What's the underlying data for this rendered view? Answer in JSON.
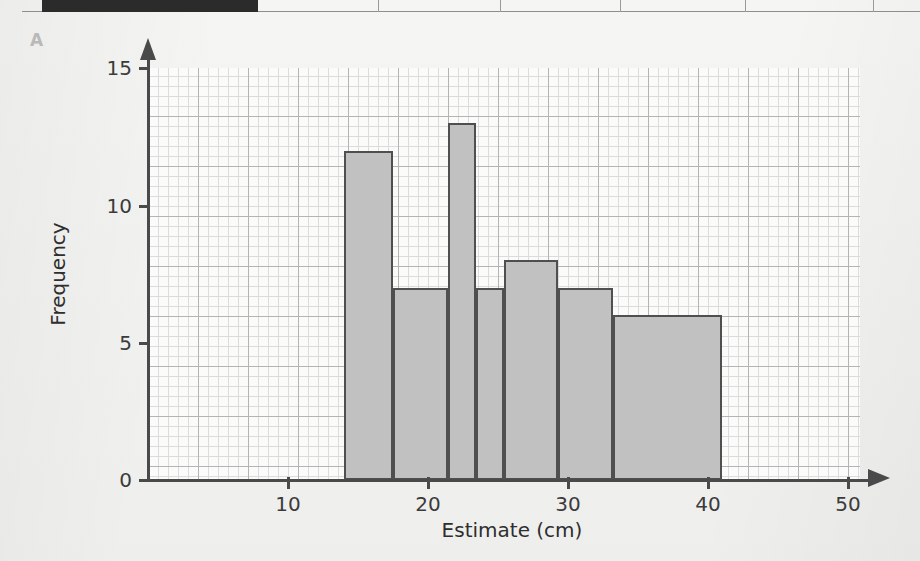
{
  "figure": {
    "label": "A"
  },
  "header_strip": {
    "black_cell": true,
    "divider_count": 5
  },
  "chart_data": {
    "type": "bar",
    "title": "",
    "subtitle": "",
    "xlabel": "Estimate (cm)",
    "ylabel": "Frequency",
    "xlim": [
      0,
      52
    ],
    "ylim": [
      0,
      15
    ],
    "grid": true,
    "legend": null,
    "xticks": [
      10,
      20,
      30,
      40,
      50
    ],
    "xtick_labels": [
      "10",
      "20",
      "30",
      "40",
      "50"
    ],
    "yticks": [
      0,
      5,
      10,
      15
    ],
    "ytick_labels": [
      "0",
      "5",
      "10",
      "15"
    ],
    "bins": [
      {
        "start": 14.0,
        "end": 17.5,
        "value": 12
      },
      {
        "start": 17.5,
        "end": 21.4,
        "value": 7
      },
      {
        "start": 21.4,
        "end": 23.4,
        "value": 13
      },
      {
        "start": 23.4,
        "end": 25.4,
        "value": 7
      },
      {
        "start": 25.4,
        "end": 29.3,
        "value": 8
      },
      {
        "start": 29.3,
        "end": 33.2,
        "value": 7
      },
      {
        "start": 33.2,
        "end": 41.0,
        "value": 6
      }
    ],
    "bar_fill": "#c1c1c1",
    "bar_edge": "#4f4f4f",
    "axis_color": "#4a4a4a",
    "grid_major_color": "#b4b4b4",
    "grid_minor_color": "#dcdcdc"
  }
}
